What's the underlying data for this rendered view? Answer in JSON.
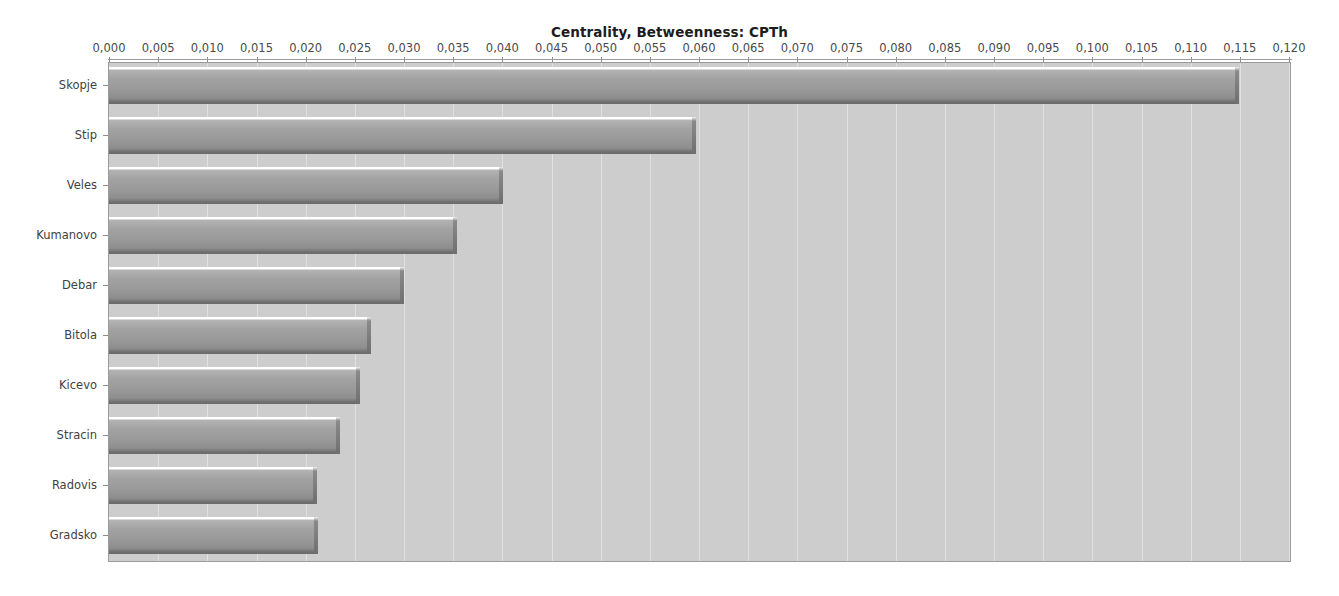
{
  "chart_data": {
    "type": "bar",
    "orientation": "horizontal",
    "title": "Centrality, Betweenness: CPTh",
    "xlabel": "",
    "ylabel": "",
    "xlim": [
      0.0,
      0.12
    ],
    "xtick_step": 0.005,
    "decimal_separator": ",",
    "grid": true,
    "grid_axis": "x",
    "legend": null,
    "axis_position": "top",
    "categories": [
      "Skopje",
      "Stip",
      "Veles",
      "Kumanovo",
      "Debar",
      "Bitola",
      "Kicevo",
      "Stracin",
      "Radovis",
      "Gradsko"
    ],
    "values": [
      0.1149,
      0.0597,
      0.0401,
      0.0354,
      0.03,
      0.0266,
      0.0255,
      0.0235,
      0.0212,
      0.0213
    ],
    "xtick_labels": [
      "0,000",
      "0,005",
      "0,010",
      "0,015",
      "0,020",
      "0,025",
      "0,030",
      "0,035",
      "0,040",
      "0,045",
      "0,050",
      "0,055",
      "0,060",
      "0,065",
      "0,070",
      "0,075",
      "0,080",
      "0,085",
      "0,090",
      "0,095",
      "0,100",
      "0,105",
      "0,110",
      "0,115",
      "0,120"
    ],
    "xtick_values": [
      0.0,
      0.005,
      0.01,
      0.015,
      0.02,
      0.025,
      0.03,
      0.035,
      0.04,
      0.045,
      0.05,
      0.055,
      0.06,
      0.065,
      0.07,
      0.075,
      0.08,
      0.085,
      0.09,
      0.095,
      0.1,
      0.105,
      0.11,
      0.115,
      0.12
    ],
    "colors": {
      "plot_background": "#cdcdcd",
      "page_background": "#ffffff",
      "bar_fill": "#9a9a9a",
      "bar_highlight": "#ffffff",
      "bar_shadow": "#6a6a6a",
      "gridline": "#ffffff",
      "axis": "#9a9a9a",
      "tick_label": "#4a4a4a",
      "title": "#1c1c1c"
    }
  }
}
